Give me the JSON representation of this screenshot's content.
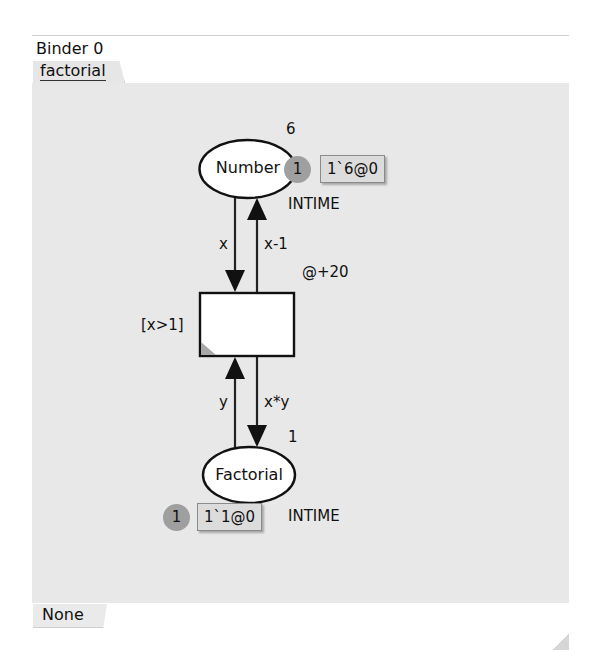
{
  "binder": {
    "title": "Binder 0",
    "tab_label": "factorial"
  },
  "bottom_tab": {
    "label": "None"
  },
  "net": {
    "places": [
      {
        "name": "Number",
        "initial_marking": "6",
        "colorset": "INTIME",
        "token_count": "1",
        "current_marking": "1`6@0"
      },
      {
        "name": "Factorial",
        "initial_marking": "1",
        "colorset": "INTIME",
        "token_count": "1",
        "current_marking": "1`1@0"
      }
    ],
    "transition": {
      "guard": "[x>1]",
      "time_delay": "@+20"
    },
    "arcs": [
      {
        "from": "Number",
        "to": "transition",
        "inscription": "x"
      },
      {
        "from": "transition",
        "to": "Number",
        "inscription": "x-1"
      },
      {
        "from": "Factorial",
        "to": "transition",
        "inscription": "y"
      },
      {
        "from": "transition",
        "to": "Factorial",
        "inscription": "x*y"
      }
    ]
  },
  "colors": {
    "canvas_bg": "#e8e8e8",
    "token_bg": "#9f9f9f",
    "marking_bg": "#dcdcdc",
    "stroke": "#111111"
  }
}
